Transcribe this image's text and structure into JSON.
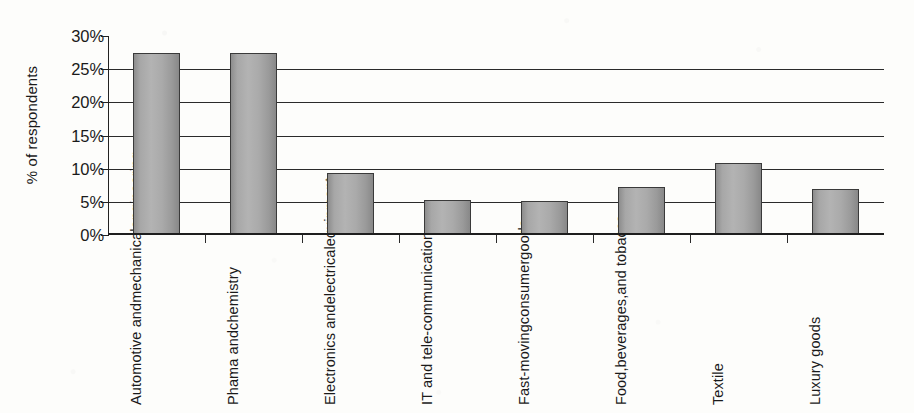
{
  "chart_data": {
    "type": "bar",
    "title": "",
    "xlabel": "",
    "ylabel": "% of respondents",
    "ylim": [
      0,
      30
    ],
    "ytick_values": [
      0,
      5,
      10,
      15,
      20,
      25,
      30
    ],
    "ytick_labels": [
      "0%",
      "5%",
      "10%",
      "15%",
      "20%",
      "25%",
      "30%"
    ],
    "grid": "horizontal",
    "legend": "none",
    "value_suffix": "%",
    "bar_color": "#a8a8a8",
    "bar_border_color": "#3a3a3a",
    "axis_color": "#222222",
    "background_color": "#fdfdfb",
    "categories": [
      "Automotive and mechanical engineering",
      "Phama and chemistry",
      "Electronics and electrical equipment",
      "IT and tele-communication",
      "Fast-moving consumer goods",
      "Food, beverages, and tobacco",
      "Textile",
      "Luxury goods"
    ],
    "category_label_lines": [
      [
        "Automotive and",
        "mechanical",
        "engineering"
      ],
      [
        "Phama and",
        "chemistry"
      ],
      [
        "Electronics and",
        "electrical",
        "equipment"
      ],
      [
        "IT and tele-",
        "communication"
      ],
      [
        "Fast-moving",
        "consumer",
        "goods"
      ],
      [
        "Food,",
        "beverages,",
        "and tobacco"
      ],
      [
        "Textile"
      ],
      [
        "Luxury goods"
      ]
    ],
    "values": [
      27.5,
      27.5,
      9.3,
      5.3,
      5.2,
      7.2,
      10.9,
      7.0
    ]
  }
}
